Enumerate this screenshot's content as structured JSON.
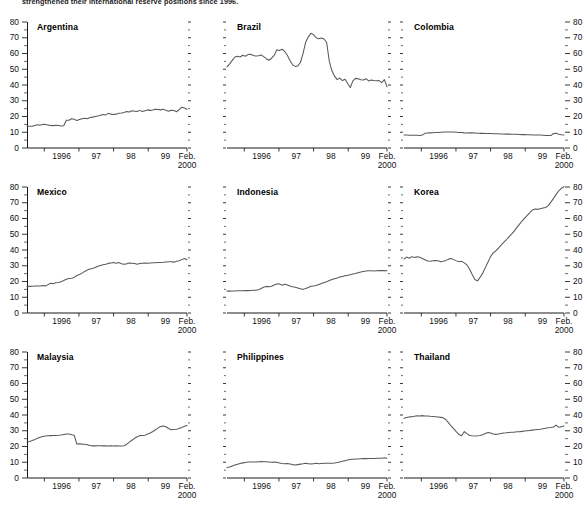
{
  "caption": "strengthened their international reserve positions since 1996.",
  "axis": {
    "ylim": [
      0,
      80
    ],
    "yticks": [
      0,
      10,
      20,
      30,
      40,
      50,
      60,
      70,
      80
    ],
    "yminor": [
      5,
      15,
      25,
      35,
      45,
      55,
      65,
      75
    ],
    "xticklabels": [
      "1996",
      "97",
      "98",
      "99",
      "Feb.\n2000"
    ],
    "xlabel_last_line1": "Feb.",
    "xlabel_last_line2": "2000",
    "xlim": [
      1995.5,
      2000.12
    ],
    "xticks": [
      1996,
      1997,
      1998,
      1999,
      2000.12
    ],
    "series_color": "#595959"
  },
  "chart_data": {
    "type": "line",
    "xlabel": "",
    "ylabel": "",
    "ylim": [
      0,
      80
    ],
    "grid": false,
    "legend": "none",
    "x_start": 1995.5,
    "x_end": 2000.12,
    "panels": [
      {
        "name": "Argentina",
        "row": 0,
        "col": 0,
        "y_axis_side": "left",
        "values": [
          13.9,
          13.8,
          13.8,
          14.3,
          14.7,
          14.4,
          15.0,
          14.9,
          14.6,
          14.3,
          14.2,
          14.4,
          14.3,
          14.0,
          14.1,
          17.6,
          17.6,
          18.6,
          18.3,
          17.4,
          18.1,
          18.6,
          18.9,
          18.6,
          19.3,
          19.6,
          20.0,
          20.3,
          20.8,
          21.3,
          21.0,
          22.0,
          21.5,
          21.3,
          21.5,
          22.0,
          22.2,
          22.6,
          23.1,
          22.8,
          23.6,
          23.4,
          23.2,
          23.9,
          23.2,
          23.7,
          24.2,
          23.9,
          24.1,
          24.6,
          24.4,
          24.2,
          24.6,
          23.9,
          23.4,
          24.0,
          23.8,
          23.0,
          24.3,
          25.9,
          25.4,
          24.6
        ]
      },
      {
        "name": "Brazil",
        "row": 0,
        "col": 1,
        "y_axis_side": "none",
        "values": [
          51.5,
          53.4,
          55.6,
          57.8,
          58.2,
          57.8,
          58.9,
          58.3,
          59.3,
          59.5,
          58.7,
          58.4,
          58.6,
          59.0,
          58.0,
          56.7,
          55.7,
          57.0,
          58.8,
          62.4,
          61.9,
          62.7,
          61.3,
          58.9,
          55.6,
          52.8,
          51.8,
          52.1,
          54.3,
          60.1,
          67.2,
          70.6,
          72.8,
          72.0,
          70.0,
          69.4,
          69.8,
          69.2,
          67.0,
          55.0,
          49.0,
          45.6,
          43.4,
          44.4,
          42.8,
          43.6,
          40.9,
          38.4,
          42.6,
          44.2,
          44.0,
          43.3,
          43.2,
          44.0,
          42.6,
          43.1,
          42.8,
          42.7,
          42.8,
          41.5,
          43.4,
          38.9
        ]
      },
      {
        "name": "Colombia",
        "row": 0,
        "col": 2,
        "y_axis_side": "right",
        "values": [
          8.2,
          8.2,
          8.1,
          8.1,
          8.1,
          8.1,
          8.0,
          8.2,
          9.3,
          9.5,
          9.6,
          9.7,
          9.8,
          9.9,
          10.0,
          10.1,
          10.1,
          10.2,
          10.2,
          10.1,
          10.0,
          9.9,
          9.8,
          9.6,
          9.5,
          9.6,
          9.6,
          9.5,
          9.4,
          9.3,
          9.3,
          9.2,
          9.2,
          9.2,
          9.1,
          9.1,
          9.0,
          8.9,
          8.9,
          8.8,
          8.8,
          8.7,
          8.7,
          8.7,
          8.6,
          8.5,
          8.5,
          8.4,
          8.4,
          8.3,
          8.3,
          8.2,
          8.2,
          8.1,
          8.0,
          8.0,
          7.9,
          9.2,
          9.4,
          8.8,
          8.4,
          8.3
        ]
      },
      {
        "name": "Mexico",
        "row": 1,
        "col": 0,
        "y_axis_side": "left",
        "values": [
          16.9,
          16.9,
          17.0,
          17.1,
          17.2,
          17.1,
          17.5,
          17.2,
          18.0,
          18.9,
          18.6,
          19.2,
          19.4,
          19.9,
          20.6,
          21.4,
          21.9,
          22.1,
          22.6,
          23.8,
          24.4,
          25.3,
          26.4,
          27.3,
          27.9,
          28.3,
          28.9,
          29.7,
          30.2,
          30.6,
          31.0,
          31.5,
          31.8,
          32.0,
          31.6,
          32.0,
          31.3,
          30.9,
          31.2,
          31.7,
          31.6,
          31.4,
          30.9,
          31.4,
          31.6,
          31.7,
          31.6,
          31.8,
          31.9,
          31.9,
          32.0,
          32.1,
          32.2,
          32.4,
          32.5,
          32.6,
          32.3,
          32.8,
          33.2,
          33.9,
          34.6,
          33.8
        ]
      },
      {
        "name": "Indonesia",
        "row": 1,
        "col": 1,
        "y_axis_side": "none",
        "values": [
          13.9,
          13.9,
          14.0,
          14.0,
          14.1,
          14.1,
          14.1,
          14.2,
          14.2,
          14.3,
          14.4,
          14.5,
          14.7,
          15.6,
          16.4,
          16.9,
          16.6,
          17.0,
          17.8,
          18.4,
          18.5,
          17.6,
          18.3,
          17.8,
          17.2,
          16.7,
          16.3,
          15.9,
          15.4,
          15.0,
          15.6,
          16.2,
          17.0,
          17.2,
          17.4,
          18.1,
          18.7,
          19.3,
          19.8,
          20.6,
          21.2,
          21.8,
          22.3,
          22.8,
          23.2,
          23.6,
          23.9,
          24.3,
          24.7,
          25.1,
          25.6,
          26.0,
          26.4,
          26.7,
          26.8,
          26.8,
          26.7,
          26.8,
          26.9,
          26.9,
          26.9,
          26.8
        ]
      },
      {
        "name": "Korea",
        "row": 1,
        "col": 2,
        "y_axis_side": "right",
        "values": [
          34.3,
          35.5,
          34.8,
          35.8,
          35.2,
          35.7,
          35.4,
          34.6,
          33.8,
          33.0,
          32.8,
          33.2,
          33.4,
          33.2,
          32.6,
          32.9,
          33.4,
          34.2,
          34.6,
          33.9,
          33.1,
          32.5,
          32.8,
          31.8,
          30.5,
          27.8,
          24.4,
          21.3,
          20.4,
          22.6,
          25.3,
          28.8,
          32.2,
          35.8,
          38.2,
          39.4,
          41.2,
          43.1,
          44.8,
          46.5,
          48.3,
          50.1,
          52.0,
          54.2,
          56.3,
          58.4,
          60.2,
          62.0,
          63.8,
          65.4,
          66.0,
          65.8,
          66.2,
          66.6,
          67.0,
          68.2,
          70.4,
          72.8,
          75.3,
          77.6,
          79.2,
          80.2
        ]
      },
      {
        "name": "Malaysia",
        "row": 2,
        "col": 0,
        "y_axis_side": "left",
        "values": [
          22.8,
          23.2,
          23.8,
          24.5,
          25.3,
          25.9,
          26.4,
          26.6,
          26.8,
          26.9,
          27.0,
          27.0,
          27.1,
          27.3,
          27.6,
          27.9,
          28.0,
          27.4,
          27.2,
          21.6,
          21.8,
          21.5,
          21.4,
          21.1,
          20.6,
          20.4,
          20.4,
          20.5,
          20.5,
          20.4,
          20.4,
          20.3,
          20.4,
          20.3,
          20.4,
          20.3,
          20.3,
          20.5,
          21.4,
          22.8,
          24.0,
          25.2,
          26.2,
          26.9,
          27.0,
          27.2,
          28.0,
          28.6,
          29.5,
          30.6,
          31.8,
          32.7,
          33.0,
          32.5,
          31.4,
          30.6,
          30.8,
          31.0,
          31.4,
          32.0,
          32.8,
          33.4
        ]
      },
      {
        "name": "Philippines",
        "row": 2,
        "col": 1,
        "y_axis_side": "none",
        "values": [
          6.6,
          7.0,
          7.6,
          8.2,
          8.7,
          9.2,
          9.6,
          9.9,
          10.1,
          10.2,
          10.2,
          10.2,
          10.3,
          10.4,
          10.3,
          10.3,
          10.2,
          10.0,
          10.1,
          10.0,
          9.5,
          9.2,
          9.0,
          9.2,
          8.9,
          8.5,
          8.2,
          8.5,
          8.8,
          9.0,
          9.3,
          9.1,
          8.9,
          9.1,
          9.3,
          9.1,
          9.2,
          9.3,
          9.4,
          9.4,
          9.3,
          9.5,
          9.8,
          10.2,
          10.6,
          11.0,
          11.4,
          11.7,
          11.9,
          12.0,
          12.1,
          12.2,
          12.3,
          12.3,
          12.4,
          12.4,
          12.4,
          12.5,
          12.5,
          12.6,
          12.8,
          12.6
        ]
      },
      {
        "name": "Thailand",
        "row": 2,
        "col": 2,
        "y_axis_side": "right",
        "values": [
          37.9,
          38.4,
          38.8,
          38.9,
          39.2,
          39.5,
          39.4,
          39.6,
          39.4,
          39.4,
          39.2,
          39.1,
          38.9,
          38.7,
          38.5,
          38.2,
          37.0,
          35.0,
          33.0,
          31.2,
          29.3,
          27.6,
          26.8,
          29.5,
          28.2,
          27.0,
          26.8,
          26.7,
          26.8,
          27.0,
          27.4,
          28.2,
          28.9,
          28.6,
          28.0,
          27.7,
          27.9,
          28.3,
          28.6,
          28.7,
          28.9,
          29.0,
          29.1,
          29.3,
          29.4,
          29.6,
          29.8,
          30.0,
          30.2,
          30.4,
          30.6,
          30.8,
          31.0,
          31.3,
          31.6,
          31.9,
          32.1,
          32.4,
          33.6,
          32.2,
          32.6,
          33.0
        ]
      }
    ]
  }
}
